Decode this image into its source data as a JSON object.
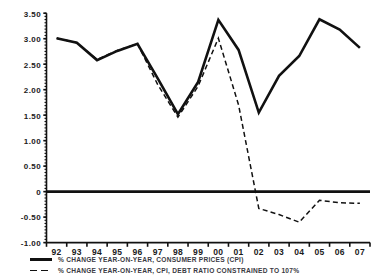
{
  "chart_data": {
    "type": "line",
    "title": "",
    "subtitle": "",
    "xlabel": "",
    "ylabel": "",
    "xlim": [
      1992,
      2007
    ],
    "ylim": [
      -1.0,
      3.5
    ],
    "grid": false,
    "legend_position": "bottom-left",
    "x": [
      "92",
      "93",
      "94",
      "95",
      "96",
      "97",
      "98",
      "99",
      "00",
      "01",
      "02",
      "03",
      "04",
      "05",
      "06",
      "07"
    ],
    "x_years_full": [
      1992,
      1993,
      1994,
      1995,
      1996,
      1997,
      1998,
      1999,
      2000,
      2001,
      2002,
      2003,
      2004,
      2005,
      2006,
      2007
    ],
    "y_ticks": [
      3.5,
      3.0,
      2.5,
      2.0,
      1.5,
      1.0,
      0.5,
      0,
      -0.5,
      -1.0
    ],
    "y_tick_labels": [
      "3.50",
      "3.00",
      "2.50",
      "2.00",
      "1.50",
      "1.00",
      "0.50",
      "0",
      "-0.50",
      "-1.00"
    ],
    "zero_line": 0,
    "series": [
      {
        "name": "% CHANGE YEAR-ON-YEAR, CONSUMER PRICES (CPI)",
        "style": "solid",
        "color": "#111111",
        "values": [
          3.01,
          2.92,
          2.58,
          2.76,
          2.9,
          2.22,
          1.52,
          2.15,
          3.37,
          2.78,
          1.55,
          2.27,
          2.66,
          3.38,
          3.18,
          2.82
        ]
      },
      {
        "name": "% CHANGE YEAR-ON-YEAR, CPI, DEBT RATIO CONSTRAINED TO 107%",
        "style": "dashed",
        "color": "#111111",
        "values": [
          3.01,
          2.92,
          2.59,
          2.77,
          2.9,
          2.1,
          1.46,
          2.07,
          3.01,
          1.7,
          -0.33,
          -0.45,
          -0.6,
          -0.17,
          -0.22,
          -0.23
        ]
      }
    ]
  },
  "legend": {
    "items": [
      {
        "label": "% CHANGE YEAR-ON-YEAR, CONSUMER PRICES (CPI)",
        "style": "solid",
        "swatch_name": "legend-swatch-solid"
      },
      {
        "label": "% CHANGE YEAR-ON-YEAR, CPI, DEBT RATIO CONSTRAINED TO 107%",
        "style": "dashed",
        "swatch_name": "legend-swatch-dashed"
      }
    ]
  },
  "colors": {
    "line": "#111111",
    "axis": "#111111",
    "text": "#1a1a1a",
    "legend_text": "#3a3a42",
    "background": "#ffffff"
  }
}
